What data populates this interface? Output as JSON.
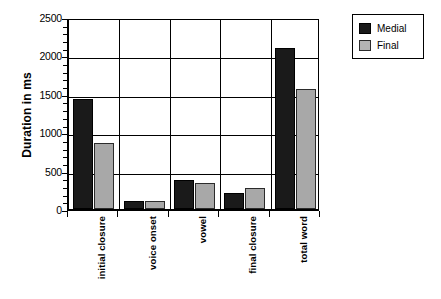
{
  "chart_data": {
    "type": "bar",
    "title": "",
    "xlabel": "",
    "ylabel": "Duration in ms",
    "ylim": [
      0,
      2500
    ],
    "yticks": [
      0,
      500,
      1000,
      1500,
      2000,
      2500
    ],
    "ytick_labels": [
      "0",
      "500",
      "1000",
      "1500",
      "2000",
      "2500"
    ],
    "grid": true,
    "legend_position": "top-right",
    "categories": [
      "initial closure",
      "voice onset",
      "vowel",
      "final closure",
      "total word"
    ],
    "series": [
      {
        "name": "Medial",
        "color": "#1a1a1a",
        "values": [
          1430,
          105,
          375,
          210,
          2100
        ]
      },
      {
        "name": "Final",
        "color": "#a8a8a8",
        "values": [
          860,
          110,
          335,
          275,
          1560
        ]
      }
    ]
  },
  "legend": {
    "items": [
      {
        "label": "Medial"
      },
      {
        "label": "Final"
      }
    ]
  }
}
